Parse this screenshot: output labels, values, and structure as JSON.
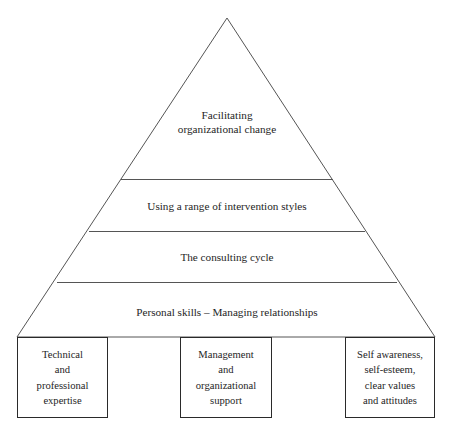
{
  "diagram": {
    "type": "pyramid",
    "stroke_color": "#555555",
    "box_stroke_color": "#2a2a2a",
    "text_color": "#252525",
    "background_color": "#ffffff",
    "tiers": [
      {
        "index": 0,
        "position": "apex",
        "label": "Facilitating\norganizational change"
      },
      {
        "index": 1,
        "position": "upper-middle",
        "label": "Using a range of intervention styles"
      },
      {
        "index": 2,
        "position": "lower-middle",
        "label": "The consulting cycle"
      },
      {
        "index": 3,
        "position": "base",
        "label": "Personal skills – Managing relationships"
      }
    ],
    "foundation_boxes": [
      {
        "index": 0,
        "label": "Technical\nand\nprofessional\nexpertise"
      },
      {
        "index": 1,
        "label": "Management\nand\norganizational\nsupport"
      },
      {
        "index": 2,
        "label": "Self awareness,\nself-esteem,\nclear values\nand attitudes"
      }
    ]
  }
}
